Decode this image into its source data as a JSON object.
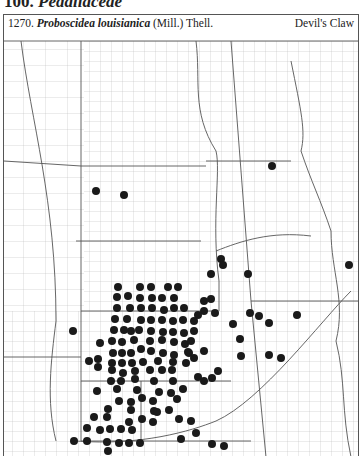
{
  "header": {
    "family_number": "100.",
    "family_name": "Pedaliaceae"
  },
  "caption": {
    "number": "1270.",
    "species": "Proboscidea louisianica",
    "authority": "(Mill.) Thell.",
    "common_name": "Devil's Claw"
  },
  "map": {
    "description": "County-level distribution map of the Great Plains region with dots marking recorded counties",
    "dot_color": "#1a1a1a",
    "line_color": "#888888",
    "dot_count_approx": 150
  }
}
